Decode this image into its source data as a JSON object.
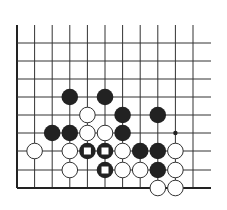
{
  "board": {
    "description": "Go problem diagram, lower-left corner region of board",
    "columns_x": [
      17,
      34.6,
      52.2,
      69.8,
      87.4,
      105,
      122.6,
      140.2,
      157.8,
      175.4,
      193
    ],
    "rows_y": [
      43,
      61,
      79,
      97,
      115,
      133,
      151,
      170,
      188
    ],
    "top_y": 25,
    "right_extent_x": 211,
    "line_color": "#333333",
    "edge_color": "#222222",
    "stone_radius": 8.3,
    "black_color": "#222222",
    "white_fill": "#ffffff",
    "white_stroke": "#333333",
    "marker_color": "#ffffff"
  },
  "stones": [
    {
      "color": "black",
      "col": 3,
      "row": 3,
      "marked": false
    },
    {
      "color": "black",
      "col": 5,
      "row": 3,
      "marked": false
    },
    {
      "color": "white",
      "col": 4,
      "row": 4,
      "marked": false
    },
    {
      "color": "black",
      "col": 6,
      "row": 4,
      "marked": false
    },
    {
      "color": "black",
      "col": 8,
      "row": 4,
      "marked": false
    },
    {
      "color": "black",
      "col": 2,
      "row": 5,
      "marked": false
    },
    {
      "color": "black",
      "col": 3,
      "row": 5,
      "marked": false
    },
    {
      "color": "white",
      "col": 4,
      "row": 5,
      "marked": false
    },
    {
      "color": "white",
      "col": 5,
      "row": 5,
      "marked": false
    },
    {
      "color": "black",
      "col": 6,
      "row": 5,
      "marked": false
    },
    {
      "color": "white",
      "col": 1,
      "row": 6,
      "marked": false
    },
    {
      "color": "white",
      "col": 3,
      "row": 6,
      "marked": false
    },
    {
      "color": "black",
      "col": 4,
      "row": 6,
      "marked": true
    },
    {
      "color": "black",
      "col": 5,
      "row": 6,
      "marked": true
    },
    {
      "color": "white",
      "col": 6,
      "row": 6,
      "marked": false
    },
    {
      "color": "black",
      "col": 7,
      "row": 6,
      "marked": false
    },
    {
      "color": "black",
      "col": 8,
      "row": 6,
      "marked": false
    },
    {
      "color": "white",
      "col": 9,
      "row": 6,
      "marked": false
    },
    {
      "color": "white",
      "col": 3,
      "row": 7,
      "marked": false
    },
    {
      "color": "black",
      "col": 5,
      "row": 7,
      "marked": true
    },
    {
      "color": "white",
      "col": 6,
      "row": 7,
      "marked": false
    },
    {
      "color": "white",
      "col": 7,
      "row": 7,
      "marked": false
    },
    {
      "color": "black",
      "col": 8,
      "row": 7,
      "marked": false
    },
    {
      "color": "white",
      "col": 9,
      "row": 7,
      "marked": false
    },
    {
      "color": "white",
      "col": 8,
      "row": 8,
      "marked": false
    },
    {
      "color": "white",
      "col": 9,
      "row": 8,
      "marked": false
    }
  ],
  "points": [
    {
      "type": "dot",
      "col": 9,
      "row": 5
    }
  ]
}
